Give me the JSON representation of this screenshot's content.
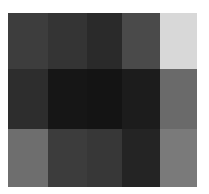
{
  "chart_data": {
    "type": "heatmap",
    "title": "",
    "xlabel": "",
    "ylabel": "",
    "colormap": "grayscale (dark = low, light = high)",
    "rows": 3,
    "cols": 5,
    "col_edges_px": [
      8,
      48,
      87,
      122,
      160,
      197
    ],
    "row_edges_px": [
      13,
      69,
      129,
      187
    ],
    "values": [
      [
        61,
        52,
        42,
        74,
        216
      ],
      [
        45,
        22,
        20,
        28,
        106
      ],
      [
        110,
        60,
        55,
        36,
        122
      ]
    ],
    "value_range": [
      0,
      255
    ],
    "grid": false,
    "legend": "none"
  }
}
